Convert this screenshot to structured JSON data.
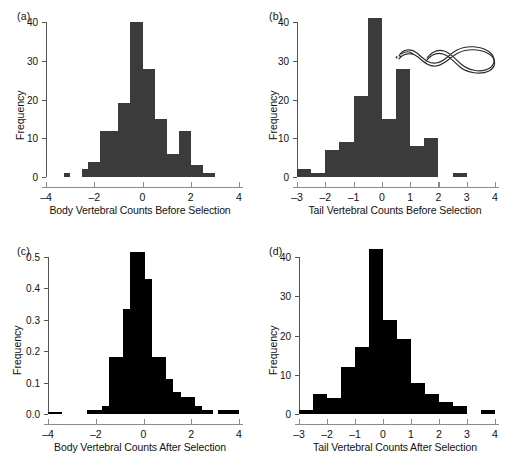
{
  "figure": {
    "panels": [
      "a",
      "b",
      "c",
      "d"
    ],
    "bar_color_gray": "#3b3b3b",
    "bar_color_black": "#000000",
    "axis_color": "#8b8b8b"
  },
  "panel_a": {
    "tag": "(a)",
    "ylabel": "Frequency",
    "xlabel": "Body Vertebral Counts Before Selection",
    "yticks": [
      "0",
      "10",
      "20",
      "30",
      "40"
    ],
    "xticks": [
      "-4",
      "-2",
      "0",
      "2",
      "4"
    ]
  },
  "panel_b": {
    "tag": "(b)",
    "ylabel": "Frequency",
    "xlabel": "Tail Vertebral Counts Before Selection",
    "yticks": [
      "0",
      "10",
      "20",
      "30",
      "40"
    ],
    "xticks": [
      "-3",
      "-2",
      "-1",
      "0",
      "1",
      "2",
      "3",
      "4"
    ],
    "snake_icon": "snake-illustration"
  },
  "panel_c": {
    "tag": "(c)",
    "ylabel": "Frequency",
    "xlabel": "Body Vertebral Counts After Selection",
    "yticks": [
      "0.0",
      "0.1",
      "0.2",
      "0.3",
      "0.4",
      "0.5"
    ],
    "xticks": [
      "-4",
      "-2",
      "0",
      "2",
      "4"
    ]
  },
  "panel_d": {
    "tag": "(d)",
    "ylabel": "Frequency",
    "xlabel": "Tail Vertebral Counts After Selection",
    "yticks": [
      "0",
      "10",
      "20",
      "30",
      "40"
    ],
    "xticks": [
      "-3",
      "-2",
      "-1",
      "0",
      "1",
      "2",
      "3",
      "4"
    ]
  },
  "chart_data": [
    {
      "type": "bar",
      "panel": "a",
      "title": "",
      "xlabel": "Body Vertebral Counts Before Selection",
      "ylabel": "Frequency",
      "xlim": [
        -4,
        4
      ],
      "ylim": [
        0,
        40
      ],
      "yticks": [
        0,
        10,
        20,
        30,
        40
      ],
      "xticks": [
        -4,
        -2,
        0,
        2,
        4
      ],
      "bin_width": 0.25,
      "grid": false,
      "bar_color": "#3b3b3b",
      "bins": [
        {
          "x0": -3.25,
          "x1": -3.0,
          "value": 1
        },
        {
          "x0": -2.5,
          "x1": -2.25,
          "value": 2
        },
        {
          "x0": -2.25,
          "x1": -2.0,
          "value": 4
        },
        {
          "x0": -2.0,
          "x1": -1.75,
          "value": 4
        },
        {
          "x0": -1.75,
          "x1": -1.5,
          "value": 12
        },
        {
          "x0": -1.5,
          "x1": -1.25,
          "value": 12
        },
        {
          "x0": -1.25,
          "x1": -1.0,
          "value": 12
        },
        {
          "x0": -1.0,
          "x1": -0.75,
          "value": 19
        },
        {
          "x0": -0.75,
          "x1": -0.5,
          "value": 19
        },
        {
          "x0": -0.5,
          "x1": -0.25,
          "value": 40
        },
        {
          "x0": -0.25,
          "x1": 0.0,
          "value": 40
        },
        {
          "x0": 0.0,
          "x1": 0.25,
          "value": 28
        },
        {
          "x0": 0.25,
          "x1": 0.5,
          "value": 28
        },
        {
          "x0": 0.5,
          "x1": 0.75,
          "value": 15
        },
        {
          "x0": 0.75,
          "x1": 1.0,
          "value": 15
        },
        {
          "x0": 1.0,
          "x1": 1.25,
          "value": 6
        },
        {
          "x0": 1.25,
          "x1": 1.5,
          "value": 6
        },
        {
          "x0": 1.5,
          "x1": 1.75,
          "value": 12
        },
        {
          "x0": 1.75,
          "x1": 2.0,
          "value": 12
        },
        {
          "x0": 2.0,
          "x1": 2.25,
          "value": 3
        },
        {
          "x0": 2.25,
          "x1": 2.5,
          "value": 3
        },
        {
          "x0": 2.5,
          "x1": 2.75,
          "value": 1
        },
        {
          "x0": 2.75,
          "x1": 3.0,
          "value": 1
        }
      ]
    },
    {
      "type": "bar",
      "panel": "b",
      "title": "",
      "xlabel": "Tail Vertebral Counts Before Selection",
      "ylabel": "Frequency",
      "xlim": [
        -3,
        4
      ],
      "ylim": [
        0,
        40
      ],
      "yticks": [
        0,
        10,
        20,
        30,
        40
      ],
      "xticks": [
        -3,
        -2,
        -1,
        0,
        1,
        2,
        3,
        4
      ],
      "bin_width": 0.5,
      "grid": false,
      "bar_color": "#3b3b3b",
      "bins": [
        {
          "x0": -3.0,
          "x1": -2.5,
          "value": 2
        },
        {
          "x0": -2.5,
          "x1": -2.0,
          "value": 1
        },
        {
          "x0": -2.0,
          "x1": -1.5,
          "value": 7
        },
        {
          "x0": -1.5,
          "x1": -1.0,
          "value": 9
        },
        {
          "x0": -1.0,
          "x1": -0.5,
          "value": 21
        },
        {
          "x0": -0.5,
          "x1": 0.0,
          "value": 41
        },
        {
          "x0": 0.0,
          "x1": 0.5,
          "value": 15
        },
        {
          "x0": 0.5,
          "x1": 1.0,
          "value": 28
        },
        {
          "x0": 1.0,
          "x1": 1.5,
          "value": 8
        },
        {
          "x0": 1.5,
          "x1": 2.0,
          "value": 10
        },
        {
          "x0": 2.5,
          "x1": 3.0,
          "value": 1
        }
      ]
    },
    {
      "type": "bar",
      "panel": "c",
      "title": "",
      "xlabel": "Body Vertebral Counts After Selection",
      "ylabel": "Frequency",
      "xlim": [
        -4,
        4
      ],
      "ylim": [
        0,
        0.5
      ],
      "yticks": [
        0.0,
        0.1,
        0.2,
        0.3,
        0.4,
        0.5
      ],
      "xticks": [
        -4,
        -2,
        0,
        2,
        4
      ],
      "bin_width": 0.3,
      "grid": false,
      "bar_color": "#000000",
      "bins": [
        {
          "x0": -4.0,
          "x1": -3.4,
          "value": 0.005
        },
        {
          "x0": -2.35,
          "x1": -2.05,
          "value": 0.012
        },
        {
          "x0": -2.05,
          "x1": -1.75,
          "value": 0.012
        },
        {
          "x0": -1.75,
          "x1": -1.45,
          "value": 0.026
        },
        {
          "x0": -1.45,
          "x1": -1.15,
          "value": 0.18
        },
        {
          "x0": -1.15,
          "x1": -0.85,
          "value": 0.18
        },
        {
          "x0": -0.85,
          "x1": -0.55,
          "value": 0.335
        },
        {
          "x0": -0.55,
          "x1": -0.25,
          "value": 0.515
        },
        {
          "x0": -0.25,
          "x1": 0.05,
          "value": 0.515
        },
        {
          "x0": 0.05,
          "x1": 0.35,
          "value": 0.43
        },
        {
          "x0": 0.35,
          "x1": 0.65,
          "value": 0.18
        },
        {
          "x0": 0.65,
          "x1": 0.95,
          "value": 0.18
        },
        {
          "x0": 0.95,
          "x1": 1.25,
          "value": 0.11
        },
        {
          "x0": 1.25,
          "x1": 1.55,
          "value": 0.07
        },
        {
          "x0": 1.55,
          "x1": 1.85,
          "value": 0.055
        },
        {
          "x0": 1.85,
          "x1": 2.15,
          "value": 0.055
        },
        {
          "x0": 2.15,
          "x1": 2.45,
          "value": 0.025
        },
        {
          "x0": 2.45,
          "x1": 2.9,
          "value": 0.012
        },
        {
          "x0": 3.1,
          "x1": 3.5,
          "value": 0.012
        },
        {
          "x0": 3.5,
          "x1": 4.0,
          "value": 0.012
        }
      ]
    },
    {
      "type": "bar",
      "panel": "d",
      "title": "",
      "xlabel": "Tail Vertebral Counts After Selection",
      "ylabel": "Frequency",
      "xlim": [
        -3,
        4
      ],
      "ylim": [
        0,
        40
      ],
      "yticks": [
        0,
        10,
        20,
        30,
        40
      ],
      "xticks": [
        -3,
        -2,
        -1,
        0,
        1,
        2,
        3,
        4
      ],
      "bin_width": 0.5,
      "grid": false,
      "bar_color": "#000000",
      "bins": [
        {
          "x0": -3.0,
          "x1": -2.5,
          "value": 1
        },
        {
          "x0": -2.5,
          "x1": -2.0,
          "value": 5
        },
        {
          "x0": -2.0,
          "x1": -1.5,
          "value": 4
        },
        {
          "x0": -1.5,
          "x1": -1.0,
          "value": 12
        },
        {
          "x0": -1.0,
          "x1": -0.5,
          "value": 17
        },
        {
          "x0": -0.5,
          "x1": 0.0,
          "value": 42
        },
        {
          "x0": 0.0,
          "x1": 0.5,
          "value": 24
        },
        {
          "x0": 0.5,
          "x1": 1.0,
          "value": 19
        },
        {
          "x0": 1.0,
          "x1": 1.5,
          "value": 8
        },
        {
          "x0": 1.5,
          "x1": 2.0,
          "value": 5
        },
        {
          "x0": 2.0,
          "x1": 2.5,
          "value": 3
        },
        {
          "x0": 2.5,
          "x1": 3.0,
          "value": 2
        },
        {
          "x0": 3.5,
          "x1": 4.0,
          "value": 1
        }
      ]
    }
  ]
}
